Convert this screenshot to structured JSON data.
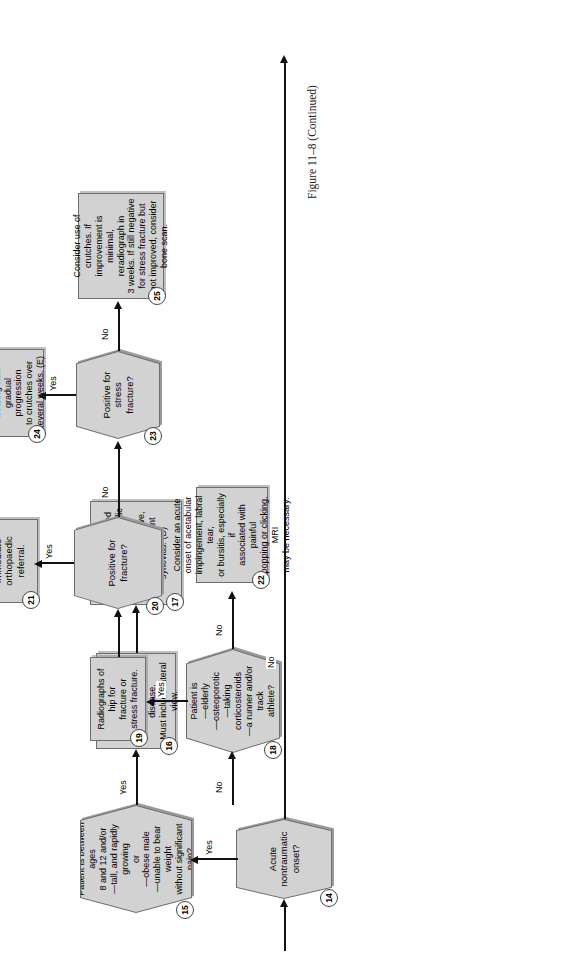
{
  "figure": {
    "caption": "Figure 11–8  (Continued)"
  },
  "nodes": {
    "n14": {
      "number": "14",
      "shape": "decision",
      "text": "Acute\nnontraumatic\nonset?"
    },
    "n15": {
      "number": "15",
      "shape": "decision",
      "text": "Patient is between ages\n8 and 12 and/or\n—tall, and rapidly growing\nor\n—obese male\n—unable to bear weight\nwithout significant\npain?"
    },
    "n16": {
      "number": "16",
      "shape": "process",
      "text": "Radiographs of hip for\npossible slipped\nepiphysis or Legg-\nCalvé-Perthes disease.\nMust include lateral view."
    },
    "n17": {
      "number": "17",
      "shape": "process",
      "text": "If positive for slipped\nepiphysis, orthopaedic\nreferral: DO NOT\nADJUST. If negative,\nconsider transient\nsynovitis. (D)"
    },
    "n18": {
      "number": "18",
      "shape": "decision",
      "text": "Patient is\n—elderly\n—osteoporotic\n—taking corticosteroids\n—a runner and/or track\nathlete?"
    },
    "n19": {
      "number": "19",
      "shape": "process",
      "text": "Radiographs of hip for\nfracture or\nstress fracture."
    },
    "n20": {
      "number": "20",
      "shape": "decision",
      "text": "Positive for\nfracture?"
    },
    "n21": {
      "number": "21",
      "shape": "process",
      "text": "Immediate\northopaedic\nreferral."
    },
    "n22": {
      "number": "22",
      "shape": "process",
      "text": "Consider an acute\nonset of acetabular\nimpingement, labral tear,\nor bursitis, especially if\nassociated with painful\npopping or clicking. MRI\nmay be necessary."
    },
    "n23": {
      "number": "23",
      "shape": "decision",
      "text": "Positive for\nstress\nfracture?"
    },
    "n24": {
      "number": "24",
      "shape": "process",
      "text": "Period of non-weight\nbearing with\ngradual progression\nto crutches over\nseveral weeks. (E)"
    },
    "n25": {
      "number": "25",
      "shape": "process",
      "text": "Consider use of crutches. If\nimprovement is minimal,\nreradiograph in\n3 weeks. If still negative\nfor stress fracture but\nnot improved, consider\nbone scan."
    }
  },
  "edges": {
    "e14_yes": {
      "label": "Yes"
    },
    "e14_no": {
      "label": "No"
    },
    "e15_yes": {
      "label": "Yes"
    },
    "e15_no": {
      "label": "No"
    },
    "e18_yes": {
      "label": "Yes"
    },
    "e18_no": {
      "label": "No"
    },
    "e20_yes": {
      "label": "Yes"
    },
    "e20_no": {
      "label": "No"
    },
    "e23_yes": {
      "label": "Yes"
    },
    "e23_no": {
      "label": "No"
    }
  },
  "colors": {
    "node_fill": "#d2d2d2",
    "node_border": "#6e6e6e",
    "line": "#111111",
    "page_background": "#ffffff"
  }
}
